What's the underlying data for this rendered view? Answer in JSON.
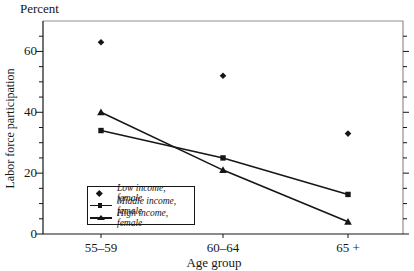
{
  "chart_data": {
    "type": "line",
    "title": "",
    "unit_label": "Percent",
    "ylabel": "Labor force participation",
    "xlabel": "Age group",
    "categories": [
      "55–59",
      "60–64",
      "65 +"
    ],
    "series": [
      {
        "name": "Low income, female",
        "marker": "diamond",
        "line": false,
        "values": [
          63,
          52,
          33
        ]
      },
      {
        "name": "Middle income, female",
        "marker": "square",
        "line": true,
        "values": [
          34,
          25,
          13
        ]
      },
      {
        "name": "High income, female",
        "marker": "triangle",
        "line": true,
        "values": [
          40,
          21,
          4
        ]
      }
    ],
    "ylim": [
      0,
      70
    ],
    "y_ticks_labeled": [
      0,
      20,
      40,
      60
    ],
    "y_minor_tick_step": 5,
    "grid": false,
    "legend_position": "inside-bottom-left",
    "colors": {
      "ink": "#161616",
      "frame_light": "#8f8f8f",
      "background": "#ffffff"
    }
  }
}
